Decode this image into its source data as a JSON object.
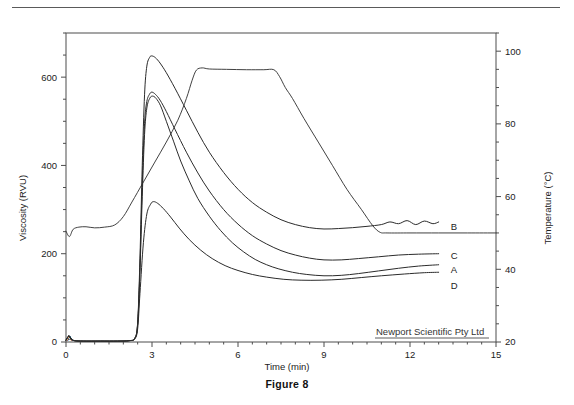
{
  "figure": {
    "caption": "Figure 8",
    "watermark": "Newport Scientific Pty Ltd"
  },
  "chart_data": {
    "type": "line",
    "title": "",
    "xlabel": "Time (min)",
    "ylabel": "Viscosity (RVU)",
    "y2label": "Temperature (°C)",
    "xlim": [
      0,
      15
    ],
    "ylim": [
      0,
      700
    ],
    "y2lim": [
      20,
      105
    ],
    "xticks": [
      0,
      3,
      6,
      9,
      12,
      15
    ],
    "xtick_labels": [
      "0",
      "3",
      "6",
      "9",
      "12",
      "15"
    ],
    "yticks": [
      0,
      200,
      400,
      600
    ],
    "ytick_labels": [
      "0",
      "200",
      "400",
      "600"
    ],
    "y_minor_ticks": [
      50,
      100,
      150,
      250,
      300,
      350,
      450,
      500,
      550,
      650,
      700
    ],
    "y2ticks": [
      20,
      40,
      60,
      80,
      100
    ],
    "y2tick_labels": [
      "20",
      "40",
      "60",
      "80",
      "100"
    ],
    "y2_minor_ticks": [
      25,
      30,
      35,
      45,
      50,
      55,
      65,
      70,
      75,
      85,
      90,
      95,
      105
    ],
    "grid": false,
    "legend": "inline-right-labels",
    "origin_annotation": "A",
    "series": [
      {
        "name": "A",
        "label": "A",
        "axis": "left",
        "label_y_value": 165,
        "points": [
          [
            0.0,
            4
          ],
          [
            0.1,
            14
          ],
          [
            0.18,
            7
          ],
          [
            0.3,
            3
          ],
          [
            0.6,
            2
          ],
          [
            1.2,
            2
          ],
          [
            1.8,
            2
          ],
          [
            2.2,
            3
          ],
          [
            2.4,
            8
          ],
          [
            2.5,
            40
          ],
          [
            2.58,
            160
          ],
          [
            2.66,
            330
          ],
          [
            2.74,
            470
          ],
          [
            2.82,
            530
          ],
          [
            2.92,
            552
          ],
          [
            3.02,
            557
          ],
          [
            3.14,
            552
          ],
          [
            3.3,
            535
          ],
          [
            3.5,
            500
          ],
          [
            3.75,
            455
          ],
          [
            4.0,
            410
          ],
          [
            4.3,
            365
          ],
          [
            4.6,
            325
          ],
          [
            5.0,
            285
          ],
          [
            5.4,
            252
          ],
          [
            5.8,
            225
          ],
          [
            6.2,
            204
          ],
          [
            6.6,
            187
          ],
          [
            7.0,
            175
          ],
          [
            7.4,
            166
          ],
          [
            7.9,
            158
          ],
          [
            8.4,
            153
          ],
          [
            9.0,
            150
          ],
          [
            9.6,
            151
          ],
          [
            10.2,
            155
          ],
          [
            10.9,
            161
          ],
          [
            11.6,
            167
          ],
          [
            12.3,
            172
          ],
          [
            13.0,
            175
          ]
        ]
      },
      {
        "name": "B",
        "label": "B",
        "axis": "left",
        "label_y_value": 262,
        "points": [
          [
            0.0,
            4
          ],
          [
            0.1,
            14
          ],
          [
            0.18,
            7
          ],
          [
            0.3,
            3
          ],
          [
            0.6,
            2
          ],
          [
            1.2,
            2
          ],
          [
            1.8,
            2
          ],
          [
            2.2,
            3
          ],
          [
            2.4,
            9
          ],
          [
            2.5,
            45
          ],
          [
            2.58,
            190
          ],
          [
            2.66,
            400
          ],
          [
            2.74,
            560
          ],
          [
            2.82,
            625
          ],
          [
            2.92,
            645
          ],
          [
            3.0,
            648
          ],
          [
            3.12,
            644
          ],
          [
            3.28,
            632
          ],
          [
            3.5,
            610
          ],
          [
            3.8,
            575
          ],
          [
            4.2,
            525
          ],
          [
            4.6,
            475
          ],
          [
            5.0,
            430
          ],
          [
            5.5,
            384
          ],
          [
            6.0,
            346
          ],
          [
            6.5,
            316
          ],
          [
            7.0,
            294
          ],
          [
            7.5,
            277
          ],
          [
            8.0,
            266
          ],
          [
            8.5,
            259
          ],
          [
            9.0,
            256
          ],
          [
            9.5,
            257
          ],
          [
            10.0,
            259
          ],
          [
            10.5,
            262
          ],
          [
            11.0,
            266
          ],
          [
            11.3,
            272
          ],
          [
            11.6,
            268
          ],
          [
            11.9,
            275
          ],
          [
            12.2,
            266
          ],
          [
            12.5,
            274
          ],
          [
            12.8,
            268
          ],
          [
            13.0,
            272
          ]
        ]
      },
      {
        "name": "C",
        "label": "C",
        "axis": "left",
        "label_y_value": 196,
        "points": [
          [
            0.0,
            4
          ],
          [
            0.1,
            14
          ],
          [
            0.18,
            7
          ],
          [
            0.3,
            3
          ],
          [
            0.6,
            2
          ],
          [
            1.2,
            2
          ],
          [
            1.8,
            2
          ],
          [
            2.2,
            3
          ],
          [
            2.4,
            8
          ],
          [
            2.5,
            42
          ],
          [
            2.58,
            170
          ],
          [
            2.66,
            360
          ],
          [
            2.74,
            495
          ],
          [
            2.82,
            545
          ],
          [
            2.92,
            562
          ],
          [
            3.0,
            566
          ],
          [
            3.12,
            561
          ],
          [
            3.28,
            548
          ],
          [
            3.5,
            522
          ],
          [
            3.8,
            482
          ],
          [
            4.2,
            430
          ],
          [
            4.6,
            383
          ],
          [
            5.0,
            342
          ],
          [
            5.5,
            300
          ],
          [
            6.0,
            267
          ],
          [
            6.5,
            241
          ],
          [
            7.0,
            222
          ],
          [
            7.5,
            207
          ],
          [
            8.0,
            197
          ],
          [
            8.5,
            190
          ],
          [
            9.0,
            186
          ],
          [
            9.6,
            186
          ],
          [
            10.2,
            189
          ],
          [
            10.9,
            193
          ],
          [
            11.6,
            197
          ],
          [
            12.3,
            199
          ],
          [
            13.0,
            200
          ]
        ]
      },
      {
        "name": "D",
        "label": "D",
        "axis": "left",
        "label_y_value": 128,
        "points": [
          [
            0.0,
            4
          ],
          [
            0.1,
            14
          ],
          [
            0.18,
            7
          ],
          [
            0.3,
            3
          ],
          [
            0.6,
            2
          ],
          [
            1.2,
            2
          ],
          [
            1.8,
            2
          ],
          [
            2.2,
            3
          ],
          [
            2.4,
            7
          ],
          [
            2.5,
            30
          ],
          [
            2.58,
            110
          ],
          [
            2.7,
            225
          ],
          [
            2.82,
            290
          ],
          [
            2.95,
            312
          ],
          [
            3.05,
            318
          ],
          [
            3.2,
            314
          ],
          [
            3.4,
            302
          ],
          [
            3.65,
            283
          ],
          [
            3.95,
            258
          ],
          [
            4.3,
            232
          ],
          [
            4.7,
            208
          ],
          [
            5.1,
            189
          ],
          [
            5.55,
            173
          ],
          [
            6.0,
            162
          ],
          [
            6.5,
            153
          ],
          [
            7.0,
            147
          ],
          [
            7.6,
            142
          ],
          [
            8.2,
            140
          ],
          [
            8.9,
            140
          ],
          [
            9.6,
            142
          ],
          [
            10.3,
            146
          ],
          [
            11.0,
            150
          ],
          [
            11.8,
            154
          ],
          [
            12.5,
            157
          ],
          [
            13.0,
            158
          ]
        ]
      },
      {
        "name": "Temperature",
        "label": "",
        "axis": "right",
        "points": [
          [
            0.0,
            50.5
          ],
          [
            0.12,
            49.0
          ],
          [
            0.25,
            51.0
          ],
          [
            0.45,
            51.6
          ],
          [
            0.7,
            51.7
          ],
          [
            1.0,
            51.4
          ],
          [
            1.35,
            51.6
          ],
          [
            1.7,
            52.2
          ],
          [
            2.0,
            54.5
          ],
          [
            2.3,
            58.5
          ],
          [
            2.7,
            64.0
          ],
          [
            3.1,
            69.5
          ],
          [
            3.5,
            75.0
          ],
          [
            3.9,
            81.0
          ],
          [
            4.2,
            87.0
          ],
          [
            4.4,
            92.0
          ],
          [
            4.55,
            94.8
          ],
          [
            4.75,
            95.4
          ],
          [
            5.0,
            95.1
          ],
          [
            5.6,
            95.0
          ],
          [
            6.3,
            94.9
          ],
          [
            6.9,
            94.9
          ],
          [
            7.25,
            94.9
          ],
          [
            7.45,
            93.0
          ],
          [
            7.65,
            90.0
          ],
          [
            7.9,
            87.0
          ],
          [
            8.3,
            81.5
          ],
          [
            8.8,
            75.0
          ],
          [
            9.3,
            68.5
          ],
          [
            9.8,
            62.0
          ],
          [
            10.3,
            56.5
          ],
          [
            10.7,
            52.0
          ],
          [
            10.95,
            50.2
          ],
          [
            11.2,
            50.0
          ],
          [
            12.0,
            50.0
          ],
          [
            13.0,
            50.0
          ],
          [
            14.0,
            50.0
          ],
          [
            15.0,
            50.0
          ]
        ]
      }
    ]
  }
}
